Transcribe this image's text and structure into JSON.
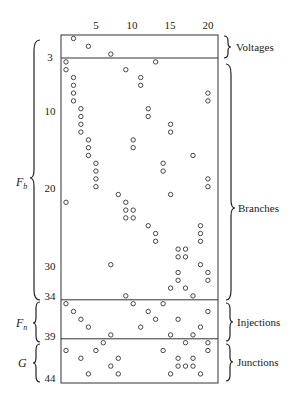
{
  "chart_data": {
    "type": "scatter",
    "title": "",
    "xlabel": "",
    "ylabel": "",
    "x_ticks": [
      5,
      10,
      15,
      20
    ],
    "y_ticks": [
      3,
      10,
      20,
      30,
      34,
      39,
      44
    ],
    "xlim": [
      1,
      20
    ],
    "ylim": [
      1,
      44
    ],
    "row_group_labels_left": [
      {
        "label": "F",
        "sub": "b",
        "rows": [
          4,
          34
        ]
      },
      {
        "label": "F",
        "sub": "n",
        "rows": [
          35,
          39
        ]
      },
      {
        "label": "G",
        "sub": "",
        "rows": [
          40,
          44
        ]
      }
    ],
    "row_group_labels_right": [
      {
        "label": "Voltages",
        "rows": [
          1,
          3
        ]
      },
      {
        "label": "Branches",
        "rows": [
          4,
          34
        ]
      },
      {
        "label": "Injections",
        "rows": [
          35,
          39
        ]
      },
      {
        "label": "Junctions",
        "rows": [
          40,
          44
        ]
      }
    ],
    "separators_after_rows": [
      3,
      34,
      39
    ],
    "nonzeros": [
      {
        "row": 1,
        "cols": [
          2
        ]
      },
      {
        "row": 2,
        "cols": [
          4
        ]
      },
      {
        "row": 3,
        "cols": [
          7
        ]
      },
      {
        "row": 4,
        "cols": [
          1,
          13
        ]
      },
      {
        "row": 5,
        "cols": [
          1,
          9
        ]
      },
      {
        "row": 6,
        "cols": [
          2,
          11
        ]
      },
      {
        "row": 7,
        "cols": [
          2,
          11
        ]
      },
      {
        "row": 8,
        "cols": [
          2,
          20
        ]
      },
      {
        "row": 9,
        "cols": [
          2,
          20
        ]
      },
      {
        "row": 10,
        "cols": [
          3,
          12
        ]
      },
      {
        "row": 11,
        "cols": [
          3,
          12
        ]
      },
      {
        "row": 12,
        "cols": [
          3,
          15
        ]
      },
      {
        "row": 13,
        "cols": [
          3,
          15
        ]
      },
      {
        "row": 14,
        "cols": [
          4,
          10
        ]
      },
      {
        "row": 15,
        "cols": [
          4,
          10
        ]
      },
      {
        "row": 16,
        "cols": [
          4,
          18
        ]
      },
      {
        "row": 17,
        "cols": [
          5,
          14
        ]
      },
      {
        "row": 18,
        "cols": [
          5,
          14
        ]
      },
      {
        "row": 19,
        "cols": [
          5,
          20
        ]
      },
      {
        "row": 20,
        "cols": [
          5,
          20
        ]
      },
      {
        "row": 21,
        "cols": [
          8,
          15
        ]
      },
      {
        "row": 22,
        "cols": [
          1,
          9
        ]
      },
      {
        "row": 23,
        "cols": [
          9,
          10
        ]
      },
      {
        "row": 24,
        "cols": [
          9,
          10
        ]
      },
      {
        "row": 25,
        "cols": [
          12,
          19
        ]
      },
      {
        "row": 26,
        "cols": [
          13,
          19
        ]
      },
      {
        "row": 27,
        "cols": [
          13,
          19
        ]
      },
      {
        "row": 28,
        "cols": [
          16,
          17
        ]
      },
      {
        "row": 29,
        "cols": [
          16,
          17
        ]
      },
      {
        "row": 30,
        "cols": [
          7,
          19
        ]
      },
      {
        "row": 31,
        "cols": [
          16,
          20
        ]
      },
      {
        "row": 32,
        "cols": [
          16,
          20
        ]
      },
      {
        "row": 33,
        "cols": [
          15,
          17
        ]
      },
      {
        "row": 34,
        "cols": [
          9,
          18
        ]
      },
      {
        "row": 35,
        "cols": [
          1,
          10,
          14
        ]
      },
      {
        "row": 36,
        "cols": [
          2,
          12,
          20
        ]
      },
      {
        "row": 37,
        "cols": [
          3,
          13,
          16
        ]
      },
      {
        "row": 38,
        "cols": [
          4,
          11,
          19
        ]
      },
      {
        "row": 39,
        "cols": [
          7,
          15,
          18
        ]
      },
      {
        "row": 40,
        "cols": [
          6,
          17,
          20
        ]
      },
      {
        "row": 41,
        "cols": [
          1,
          5,
          14,
          20
        ]
      },
      {
        "row": 42,
        "cols": [
          3,
          8,
          16,
          18
        ]
      },
      {
        "row": 43,
        "cols": [
          7,
          16,
          17,
          18
        ]
      },
      {
        "row": 44,
        "cols": [
          4,
          8,
          15,
          19
        ]
      }
    ]
  },
  "labels": {
    "x_ticks": [
      "5",
      "10",
      "15",
      "20"
    ],
    "y_ticks": [
      "3",
      "10",
      "20",
      "30",
      "34",
      "39",
      "44"
    ],
    "left": {
      "fb": "F",
      "fb_sub": "b",
      "fn": "F",
      "fn_sub": "n",
      "g": "G"
    },
    "right": {
      "voltages": "Voltages",
      "branches": "Branches",
      "injections": "Injections",
      "junctions": "Junctions"
    }
  }
}
